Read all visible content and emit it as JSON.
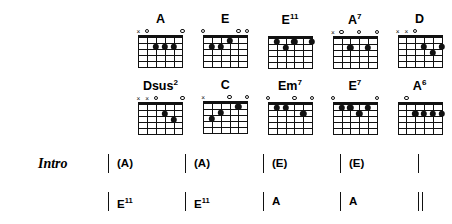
{
  "document": {
    "type": "guitar-chord-chart",
    "strings": 6,
    "frets": 5
  },
  "chord_rows": [
    {
      "row_id": "chord-row-1",
      "chords": [
        {
          "name": "A",
          "base": "A",
          "sup": "",
          "markers": [
            "x",
            "o",
            "",
            "",
            "",
            "o"
          ],
          "dots": [
            {
              "string": 4,
              "fret": 2
            },
            {
              "string": 3,
              "fret": 2
            },
            {
              "string": 2,
              "fret": 2
            }
          ]
        },
        {
          "name": "E",
          "base": "E",
          "sup": "",
          "markers": [
            "o",
            "",
            "",
            "",
            "o",
            "o"
          ],
          "dots": [
            {
              "string": 5,
              "fret": 2
            },
            {
              "string": 4,
              "fret": 2
            },
            {
              "string": 3,
              "fret": 1
            }
          ]
        },
        {
          "name": "E11",
          "base": "E",
          "sup": "11",
          "markers": [
            "",
            "",
            "",
            "",
            "",
            ""
          ],
          "dots": [
            {
              "string": 5,
              "fret": 1
            },
            {
              "string": 4,
              "fret": 2
            },
            {
              "string": 3,
              "fret": 1
            },
            {
              "string": 1,
              "fret": 1
            }
          ]
        },
        {
          "name": "A7",
          "base": "A",
          "sup": "7",
          "markers": [
            "x",
            "o",
            "",
            "o",
            "",
            "o"
          ],
          "dots": [
            {
              "string": 4,
              "fret": 2
            },
            {
              "string": 2,
              "fret": 2
            }
          ]
        },
        {
          "name": "D",
          "base": "D",
          "sup": "",
          "markers": [
            "x",
            "x",
            "o",
            "",
            "",
            ""
          ],
          "dots": [
            {
              "string": 3,
              "fret": 2
            },
            {
              "string": 1,
              "fret": 2
            },
            {
              "string": 2,
              "fret": 3
            }
          ]
        }
      ]
    },
    {
      "row_id": "chord-row-2",
      "chords": [
        {
          "name": "Dsus2",
          "base": "Dsus",
          "sup": "2",
          "markers": [
            "x",
            "x",
            "o",
            "",
            "",
            "o"
          ],
          "dots": [
            {
              "string": 3,
              "fret": 2
            },
            {
              "string": 2,
              "fret": 3
            }
          ]
        },
        {
          "name": "C",
          "base": "C",
          "sup": "",
          "markers": [
            "x",
            "",
            "",
            "o",
            "",
            "o"
          ],
          "dots": [
            {
              "string": 5,
              "fret": 3
            },
            {
              "string": 4,
              "fret": 2
            },
            {
              "string": 2,
              "fret": 1
            }
          ]
        },
        {
          "name": "Em7",
          "base": "Em",
          "sup": "7",
          "markers": [
            "o",
            "",
            "",
            "o",
            "",
            "o"
          ],
          "dots": [
            {
              "string": 5,
              "fret": 1
            },
            {
              "string": 4,
              "fret": 1
            },
            {
              "string": 2,
              "fret": 2
            }
          ]
        },
        {
          "name": "E7",
          "base": "E",
          "sup": "7",
          "markers": [
            "o",
            "",
            "",
            "",
            "",
            "o"
          ],
          "dots": [
            {
              "string": 5,
              "fret": 1
            },
            {
              "string": 4,
              "fret": 1
            },
            {
              "string": 3,
              "fret": 2
            },
            {
              "string": 2,
              "fret": 1
            }
          ]
        },
        {
          "name": "A6",
          "base": "A",
          "sup": "6",
          "markers": [
            "",
            "o",
            "",
            "",
            "",
            ""
          ],
          "dots": [
            {
              "string": 4,
              "fret": 2
            },
            {
              "string": 3,
              "fret": 2
            },
            {
              "string": 2,
              "fret": 2
            },
            {
              "string": 1,
              "fret": 2
            }
          ]
        }
      ]
    }
  ],
  "progression": {
    "section_label": "Intro",
    "rows": [
      {
        "row_id": "prog-row-1",
        "measures": [
          {
            "x": 108,
            "symbol_base": "(A)",
            "symbol_sup": "",
            "bar": "single"
          },
          {
            "x": 185,
            "symbol_base": "(A)",
            "symbol_sup": "",
            "bar": "single"
          },
          {
            "x": 263,
            "symbol_base": "(E)",
            "symbol_sup": "",
            "bar": "single"
          },
          {
            "x": 340,
            "symbol_base": "(E)",
            "symbol_sup": "",
            "bar": "single"
          },
          {
            "x": 418,
            "symbol_base": "",
            "symbol_sup": "",
            "bar": "single"
          }
        ]
      },
      {
        "row_id": "prog-row-2",
        "measures": [
          {
            "x": 108,
            "symbol_base": "E",
            "symbol_sup": "11",
            "bar": "single"
          },
          {
            "x": 185,
            "symbol_base": "E",
            "symbol_sup": "11",
            "bar": "single"
          },
          {
            "x": 263,
            "symbol_base": "A",
            "symbol_sup": "",
            "bar": "single"
          },
          {
            "x": 340,
            "symbol_base": "A",
            "symbol_sup": "",
            "bar": "single"
          },
          {
            "x": 418,
            "symbol_base": "",
            "symbol_sup": "",
            "bar": "double"
          }
        ]
      }
    ]
  },
  "colors": {
    "ink": "#111111",
    "background": "#ffffff"
  }
}
